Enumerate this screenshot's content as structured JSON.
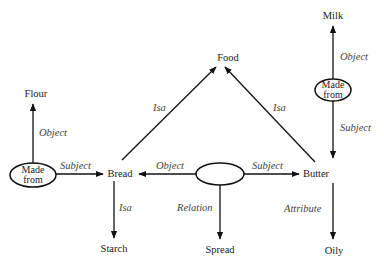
{
  "diagram": {
    "type": "semantic-network",
    "nodes": {
      "food": "Food",
      "milk": "Milk",
      "flour": "Flour",
      "bread": "Bread",
      "butter": "Butter",
      "starch": "Starch",
      "spread": "Spread",
      "oily": "Oily"
    },
    "relation_nodes": {
      "made_from_left": {
        "line1": "Made",
        "line2": "from"
      },
      "made_from_right": {
        "line1": "Made",
        "line2": "from"
      },
      "relation_center": {
        "line1": "",
        "line2": ""
      }
    },
    "edges": {
      "bread_isa_food": "Isa",
      "butter_isa_food": "Isa",
      "madefrom_left_object_flour": "Object",
      "madefrom_left_subject_bread": "Subject",
      "bread_isa_starch": "Isa",
      "center_object_bread": "Object",
      "center_subject_butter": "Subject",
      "center_relation_spread": "Relation",
      "madefrom_right_object_milk": "Object",
      "madefrom_right_subject_butter": "Subject",
      "butter_attribute_oily": "Attribute"
    },
    "colors": {
      "line": "#111111",
      "node_text": "#222222",
      "edge_label": "#444444",
      "background": "#ffffff"
    }
  }
}
